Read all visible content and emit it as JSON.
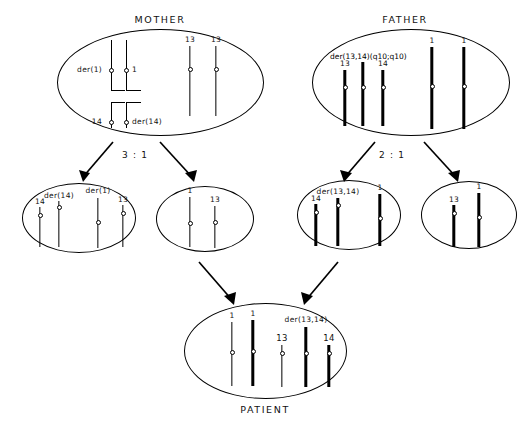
{
  "titles": {
    "mother": "MOTHER",
    "father": "FATHER",
    "patient": "PATIENT"
  },
  "ratios": {
    "mother_segregation": "3 : 1",
    "father_segregation": "2 : 1"
  },
  "labels": {
    "der1": "der(1)",
    "one": "1",
    "fourteen": "14",
    "der14": "der(14)",
    "thirteen": "13",
    "der1314_full": "der(13,14)(q10;q10)",
    "der1314": "der(13,14)"
  },
  "mother_cell": {
    "name": "mother-karyotype",
    "quadrivalent": {
      "top_left_label": "der(1)",
      "top_right_label": "1",
      "bottom_left_label": "14",
      "bottom_right_label": "der(14)"
    },
    "chromosomes": [
      {
        "label": "13",
        "thick": false
      },
      {
        "label": "13",
        "thick": false
      }
    ]
  },
  "father_cell": {
    "name": "father-karyotype",
    "header_label": "der(13,14)(q10;q10)",
    "chromosomes": [
      {
        "label": "13",
        "thick": true
      },
      {
        "label": "",
        "thick": true
      },
      {
        "label": "14",
        "thick": true
      },
      {
        "label": "1",
        "thick": true
      },
      {
        "label": "1",
        "thick": true
      }
    ]
  },
  "gametes": [
    {
      "name": "maternal-gamete-unbalanced",
      "chromosomes": [
        {
          "label": "14",
          "thick": false
        },
        {
          "label": "der(14)",
          "thick": false
        },
        {
          "label": "der(1)",
          "thick": false
        },
        {
          "label": "13",
          "thick": false
        }
      ]
    },
    {
      "name": "maternal-gamete-normal",
      "chromosomes": [
        {
          "label": "1",
          "thick": false
        },
        {
          "label": "13",
          "thick": false
        }
      ]
    },
    {
      "name": "paternal-gamete-unbalanced",
      "chromosomes": [
        {
          "label": "14",
          "thick": true
        },
        {
          "label": "der(13,14)",
          "thick": true
        },
        {
          "label": "1",
          "thick": true
        }
      ]
    },
    {
      "name": "paternal-gamete-normal",
      "chromosomes": [
        {
          "label": "13",
          "thick": true
        },
        {
          "label": "1",
          "thick": true
        }
      ]
    }
  ],
  "patient_cell": {
    "name": "patient-karyotype",
    "chromosomes": [
      {
        "label": "1",
        "thick": false
      },
      {
        "label": "1",
        "thick": true
      },
      {
        "label": "13",
        "thick": false
      },
      {
        "label": "der(13,14)",
        "thick": true
      },
      {
        "label": "14",
        "thick": true
      }
    ]
  }
}
